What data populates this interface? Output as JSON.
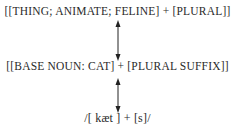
{
  "diagram": {
    "title": "",
    "levels": [
      {
        "name": "semantic",
        "text": "[[THING;  ANIMATE;  FELINE] + [PLURAL]]"
      },
      {
        "name": "morphological",
        "text": "[[BASE NOUN:  CAT] + [PLURAL SUFFIX]]"
      },
      {
        "name": "phonological",
        "text": "/[ kæt ] + [s]/"
      }
    ],
    "connections": [
      {
        "from": "semantic",
        "to": "morphological",
        "type": "bidirectional-arrow"
      },
      {
        "from": "morphological",
        "to": "phonological",
        "type": "bidirectional-arrow"
      }
    ],
    "colors": {
      "text": "#2a2a2a",
      "arrow": "#222222"
    }
  }
}
